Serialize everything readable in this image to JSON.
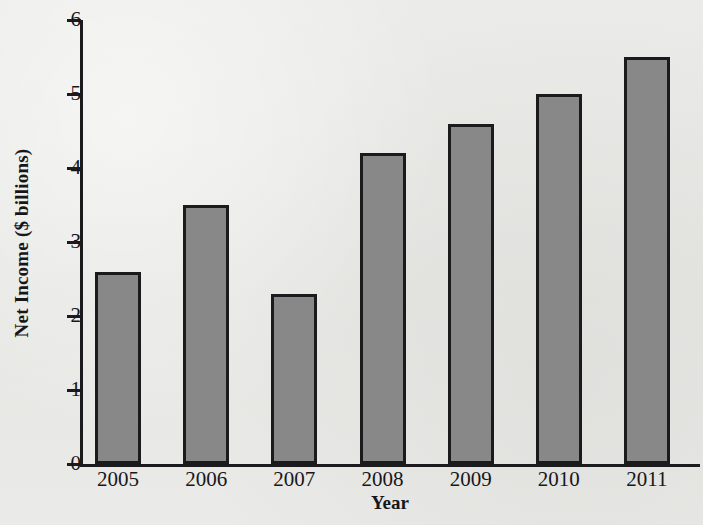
{
  "chart_data": {
    "type": "bar",
    "title": "",
    "xlabel": "Year",
    "ylabel": "Net Income ($ billions)",
    "categories": [
      "2005",
      "2006",
      "2007",
      "2008",
      "2009",
      "2010",
      "2011"
    ],
    "values": [
      2.6,
      3.5,
      2.3,
      4.2,
      4.6,
      5.0,
      5.5
    ],
    "ylim": [
      0,
      6
    ],
    "ytick_labels": [
      "0",
      "1",
      "2",
      "3",
      "4",
      "5",
      "6"
    ],
    "ytick_values": [
      0,
      1,
      2,
      3,
      4,
      5,
      6
    ],
    "grid": false,
    "legend": false,
    "legend_position": "none",
    "bar_fill_color": "#888888",
    "bar_edge_color": "#1b1b1e",
    "axis_color": "#1b1b1e",
    "background_color": "#e9e9e7",
    "text_color": "#17171a"
  }
}
